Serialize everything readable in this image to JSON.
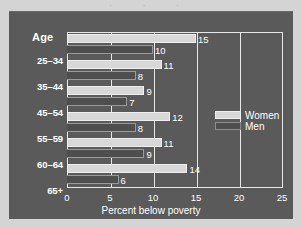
{
  "chart_data": {
    "type": "bar",
    "orientation": "horizontal",
    "title": "",
    "xlabel": "Percent below poverty",
    "ylabel": "Age",
    "xlim": [
      0,
      25
    ],
    "xticks": [
      0,
      5,
      10,
      15,
      20,
      25
    ],
    "grid": true,
    "legend_position": "right",
    "categories": [
      "25–34",
      "35–44",
      "45–54",
      "55–59",
      "60–64",
      "65+"
    ],
    "series": [
      {
        "name": "Women",
        "color": "#d8d8d8",
        "values": [
          15,
          11,
          9,
          12,
          11,
          14
        ]
      },
      {
        "name": "Men",
        "color": "#4e4e4e",
        "values": [
          10,
          8,
          7,
          8,
          9,
          6
        ]
      }
    ]
  },
  "axis": {
    "y_title": "Age",
    "x_title": "Percent below poverty",
    "x_tick_labels": [
      "0",
      "5",
      "10",
      "15",
      "20",
      "25"
    ]
  },
  "legend": {
    "items": [
      {
        "label": "Women",
        "swatch": "women-swatch"
      },
      {
        "label": "Men",
        "swatch": "men-swatch"
      }
    ]
  },
  "bar_value_labels": {
    "women": [
      "15",
      "11",
      "9",
      "12",
      "11",
      "14"
    ],
    "men": [
      "10",
      "8",
      "7",
      "8",
      "9",
      "6"
    ]
  }
}
